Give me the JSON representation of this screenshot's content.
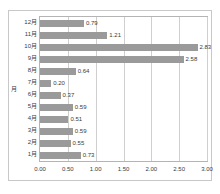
{
  "chart_data": {
    "type": "bar",
    "orientation": "horizontal",
    "title": "",
    "xlabel": "",
    "ylabel": "月",
    "xlim": [
      0.0,
      3.0
    ],
    "xticks": [
      "0.00",
      "0.50",
      "1.00",
      "1.50",
      "2.00",
      "2.50",
      "3.00"
    ],
    "xtick_values": [
      0.0,
      0.5,
      1.0,
      1.5,
      2.0,
      2.5,
      3.0
    ],
    "grid": "vertical",
    "legend": "none",
    "bar_color": "#9a9a9a",
    "categories": [
      "12月",
      "11月",
      "10月",
      "9月",
      "8月",
      "7月",
      "6月",
      "5月",
      "4月",
      "3月",
      "2月",
      "1月"
    ],
    "values": [
      0.79,
      1.21,
      2.83,
      2.58,
      0.64,
      0.2,
      0.37,
      0.59,
      0.51,
      0.59,
      0.55,
      0.73
    ],
    "data_labels": [
      "0.79",
      "1.21",
      "2.83",
      "2.58",
      "0.64",
      "0.20",
      "0.37",
      "0.59",
      "0.51",
      "0.59",
      "0.55",
      "0.73"
    ]
  }
}
